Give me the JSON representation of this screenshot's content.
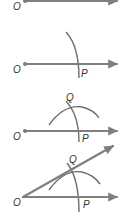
{
  "figure": {
    "line_color": "#7f7f7f",
    "label_color": "#333333",
    "steps": [
      {
        "step": 1,
        "labels": {
          "vertex": "O"
        },
        "description": "Draw ray from O"
      },
      {
        "step": 2,
        "labels": {
          "vertex": "O",
          "point": "P"
        },
        "description": "Draw arc centered at O intersecting ray at P"
      },
      {
        "step": 3,
        "labels": {
          "vertex": "O",
          "point": "P",
          "intersection": "Q"
        },
        "description": "Draw arc centered at P intersecting first arc at Q"
      },
      {
        "step": 4,
        "labels": {
          "vertex": "O",
          "point": "P",
          "intersection": "Q"
        },
        "description": "Draw ray OQ"
      }
    ]
  }
}
